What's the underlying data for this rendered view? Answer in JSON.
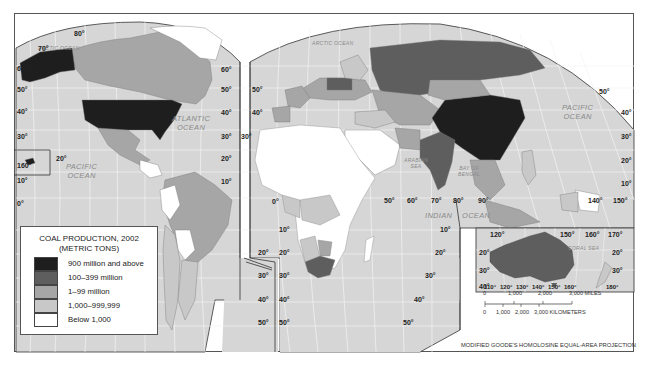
{
  "map": {
    "title": "Coal Production, 2002",
    "projection": "MODIFIED GOODE'S HOMOLOSINE EQUAL-AREA PROJECTION",
    "colors": {
      "ocean": "#d6d6d6",
      "graticule": "#f2f2f2",
      "tier1": "#1e1e1e",
      "tier2": "#5e5e5e",
      "tier3": "#a6a6a6",
      "tier4": "#c8c8c8",
      "tier5": "#ffffff"
    },
    "oceans": {
      "arctic_left": "ARCTIC OCEAN",
      "arctic_right": "ARCTIC OCEAN",
      "atlantic_1": "ATLANTIC",
      "atlantic_2": "OCEAN",
      "pacific_left_1": "PACIFIC",
      "pacific_left_2": "OCEAN",
      "pacific_right_1": "PACIFIC",
      "pacific_right_2": "OCEAN",
      "indian_1": "INDIAN",
      "indian_2": "OCEAN",
      "arabian_1": "ARABIAN",
      "arabian_2": "SEA",
      "bengal_1": "BAY OF",
      "bengal_2": "BENGAL",
      "coral": "CORAL   SEA"
    },
    "lat_labels_left": [
      "80°",
      "70°",
      "60°",
      "50°",
      "40°",
      "30°",
      "20°",
      "10°",
      "0°"
    ],
    "inset_hawaii_lon": "160°",
    "inset_hawaii_lat": "20°",
    "americas_lat_right": [
      "60°",
      "50°",
      "40°",
      "30°",
      "20°",
      "10°"
    ],
    "africa_lat_left": [
      "50°",
      "40°",
      "30°",
      "20°",
      "10°",
      "0°"
    ],
    "south_lat_left": [
      "10°",
      "20°",
      "30°",
      "40°",
      "50°"
    ],
    "south_lat_right": [
      "10°",
      "20°",
      "30°",
      "40°",
      "50°"
    ],
    "south_america_lat": [
      "10°",
      "20°",
      "30°",
      "40°",
      "50°"
    ],
    "east_lat": [
      "50°",
      "40°",
      "30°",
      "20°",
      "10°"
    ],
    "lon_labels_indian": [
      "50°",
      "60°",
      "70°",
      "80°",
      "90°"
    ],
    "lon_labels_pacific": [
      "140°",
      "150°"
    ],
    "australia_inset": {
      "lon_top": [
        "120°",
        "150°",
        "160°",
        "170°"
      ],
      "lon_bottom": [
        "110°",
        "120°",
        "130°",
        "140°",
        "150°",
        "160°",
        "180°"
      ],
      "lat_left": [
        "20°",
        "30°",
        "40°"
      ],
      "lat_right": [
        "20°",
        "30°"
      ]
    }
  },
  "legend": {
    "title_line1": "COAL PRODUCTION, 2002",
    "title_line2": "(METRIC TONS)",
    "items": [
      {
        "label": "900 million and above",
        "color": "#1e1e1e"
      },
      {
        "label": "100–399 million",
        "color": "#5e5e5e"
      },
      {
        "label": "1–99 million",
        "color": "#a6a6a6"
      },
      {
        "label": "1,000–999,999",
        "color": "#c8c8c8"
      },
      {
        "label": "Below 1,000",
        "color": "#ffffff"
      }
    ]
  },
  "scale_bar": {
    "miles": [
      "0",
      "1,000",
      "2,000",
      "3,000 MILES"
    ],
    "kilometers": [
      "0",
      "1,000",
      "2,000",
      "3,000 KILOMETERS"
    ]
  }
}
